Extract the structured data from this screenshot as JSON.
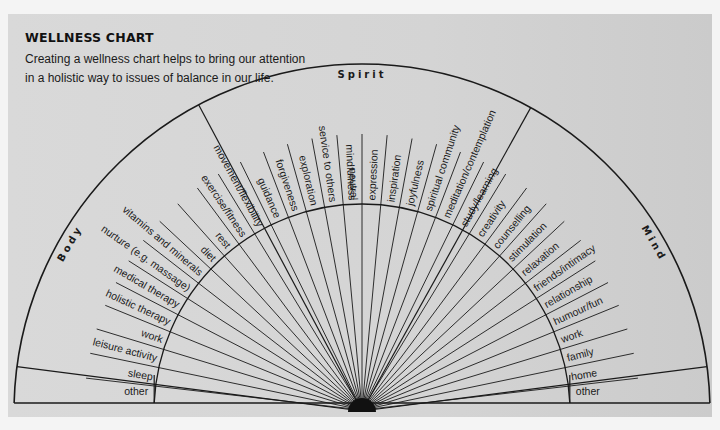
{
  "header": {
    "title": "WELLNESS CHART",
    "description": "Creating a wellness chart helps to bring our attention in a holistic way to issues of balance in our life."
  },
  "sections": {
    "body": "Body",
    "spirit": "Spirit",
    "mind": "Mind"
  },
  "corners": {
    "left_other": "other",
    "right_other": "other"
  },
  "colors": {
    "panel": "#d6d6d6",
    "line": "#1a1a1a",
    "page": "#f4f4f4"
  },
  "chart_data": {
    "type": "radial-diagram",
    "title": "WELLNESS CHART",
    "subtitle": "Creating a wellness chart helps to bring our attention in a holistic way to issues of balance in our life.",
    "sections": [
      {
        "name": "Body",
        "items": [
          "other",
          "sleep",
          "leisure activity",
          "work",
          "holistic therapy",
          "medical therapy",
          "nurture (e.g. massage)",
          "vitamins and minerals",
          "diet",
          "rest",
          "exercise/fitness",
          "movement/flexibility"
        ]
      },
      {
        "name": "Spirit",
        "items": [
          "guidance",
          "forgiveness",
          "exploration",
          "service to others",
          "mindfulness",
          "neutral",
          "expression",
          "inspiration",
          "joyfulness",
          "spiritual community",
          "meditation/contemplation"
        ]
      },
      {
        "name": "Mind",
        "items": [
          "study/learning",
          "creativity",
          "counselling",
          "stimulation",
          "relaxation",
          "friends/intimacy",
          "relationship",
          "humour/fun",
          "work",
          "family",
          "home",
          "other"
        ]
      }
    ],
    "labels_ordered_left_to_right": [
      "sleep",
      "leisure activity",
      "work",
      "holistic therapy",
      "medical therapy",
      "nurture (e.g. massage)",
      "vitamins and minerals",
      "diet",
      "rest",
      "exercise/fitness",
      "movement/flexibility",
      "guidance",
      "forgiveness",
      "exploration",
      "service to others",
      "mindfulness",
      "neutral",
      "expression",
      "inspiration",
      "joyfulness",
      "spiritual community",
      "meditation/contemplation",
      "study/learning",
      "creativity",
      "counselling",
      "stimulation",
      "relaxation",
      "friends/intimacy",
      "relationship",
      "humour/fun",
      "work",
      "family",
      "home"
    ]
  }
}
